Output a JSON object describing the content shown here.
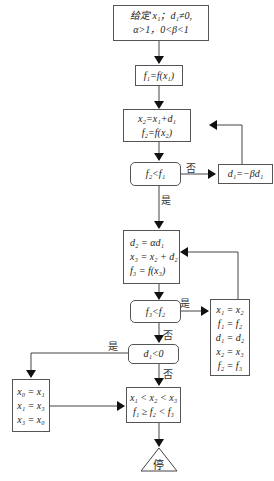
{
  "flowchart": {
    "start": {
      "line1": "给定 x₁；d₁≠0,",
      "line2": "α>1，0<β<1"
    },
    "f1": "f₁=f(x₁)",
    "step": {
      "line1": "x₂=x₁+d₁",
      "line2": "f₂=f(x₂)"
    },
    "cond1": "f₂<f₁",
    "cond1_no": "否",
    "cond1_yes": "是",
    "reverse": "d₁=−βd₁",
    "expand": {
      "line1": "d₂ = αd₁",
      "line2": "x₃ = x₂ + d₂",
      "line3": "f₃ = f(x₃)"
    },
    "cond2": "f₃<f₂",
    "cond2_yes": "是",
    "cond2_no": "否",
    "shift": [
      "x₁ = x₂",
      "f₁ = f₂",
      "d₁ = d₂",
      "x₂ = x₃",
      "f₂ = f₃"
    ],
    "cond3": "d₁<0",
    "cond3_yes": "是",
    "cond3_no": "否",
    "swap": [
      "x₀ = x₁",
      "x₁ = x₃",
      "x₃ = x₀"
    ],
    "result": {
      "line1": "x₁ < x₂ < x₃",
      "line2": "f₁ ≥ f₂ < f₃"
    },
    "stop": "停"
  }
}
